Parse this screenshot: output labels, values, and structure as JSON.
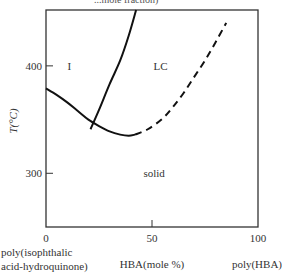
{
  "chart_data": {
    "type": "line",
    "title_partial": "...mole fraction)",
    "xlabel": "HBA(mole %)",
    "ylabel": "T(°C)",
    "xlim": [
      0,
      100
    ],
    "ylim": [
      250,
      452
    ],
    "x_ticks": [
      0,
      50,
      100
    ],
    "x_tick_labels": [
      "0",
      "50",
      "100"
    ],
    "y_ticks": [
      300,
      400
    ],
    "y_tick_labels": [
      "300",
      "400"
    ],
    "x_end_labels": {
      "left": [
        "poly(isophthalic",
        "acid-hydroquinone)"
      ],
      "right": "poly(HBA)"
    },
    "grid": false,
    "legend": "none",
    "regions": [
      {
        "label": "I",
        "x": 11,
        "y": 396
      },
      {
        "label": "LC",
        "x": 54,
        "y": 396
      },
      {
        "label": "solid",
        "x": 51,
        "y": 297
      }
    ],
    "series": [
      {
        "name": "isotropic-lower-boundary",
        "style": "solid",
        "points": [
          [
            0,
            379
          ],
          [
            5,
            373
          ],
          [
            10,
            366
          ],
          [
            15,
            358
          ],
          [
            20,
            350
          ],
          [
            25,
            344
          ],
          [
            30,
            339
          ],
          [
            35,
            336
          ],
          [
            39,
            335
          ],
          [
            42,
            336
          ]
        ]
      },
      {
        "name": "isotropic-LC-boundary",
        "style": "solid",
        "points": [
          [
            21,
            341
          ],
          [
            25,
            359
          ],
          [
            30,
            383
          ],
          [
            35,
            405
          ],
          [
            39,
            428
          ],
          [
            42.5,
            452
          ]
        ]
      },
      {
        "name": "LC-solid-boundary",
        "style": "dashed",
        "points": [
          [
            42,
            336
          ],
          [
            48,
            341
          ],
          [
            55,
            351
          ],
          [
            60,
            362
          ],
          [
            65,
            375
          ],
          [
            70,
            390
          ],
          [
            75,
            405
          ],
          [
            80,
            422
          ],
          [
            85,
            440
          ]
        ]
      }
    ]
  }
}
